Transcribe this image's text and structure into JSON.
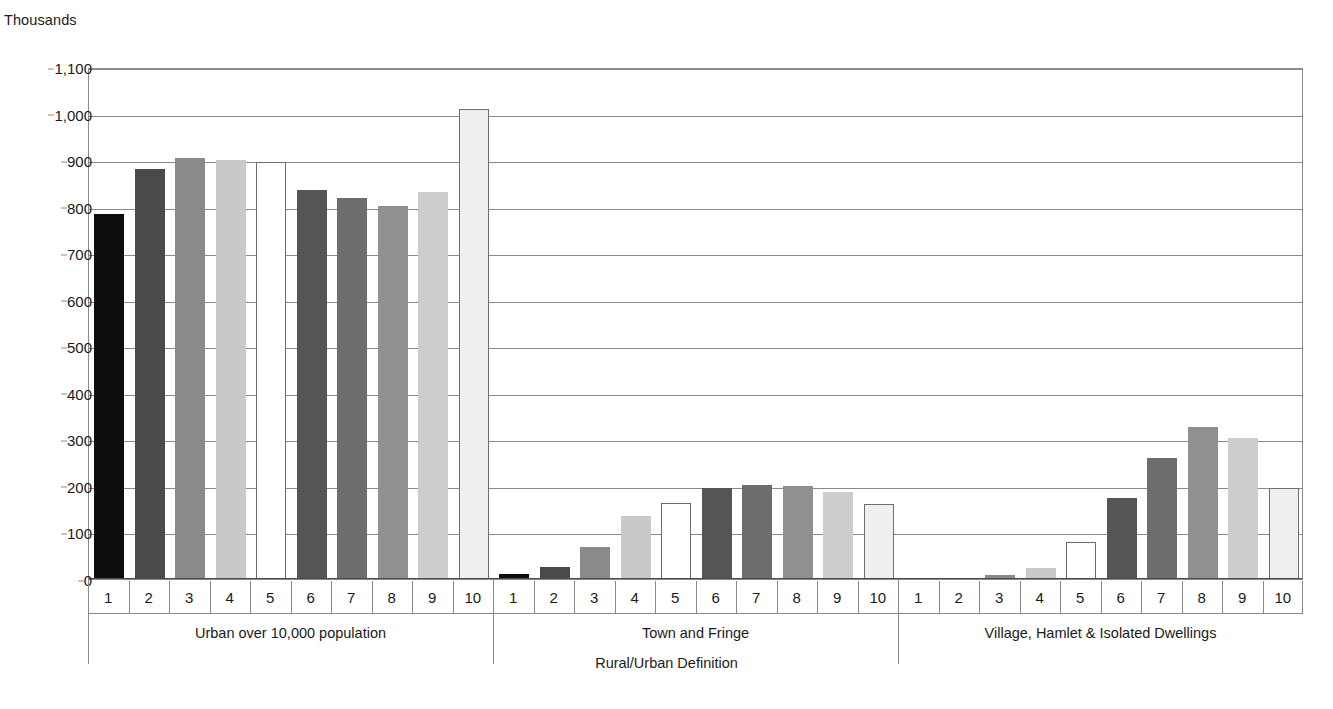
{
  "chart_data": {
    "type": "bar",
    "title": "",
    "subtitle": "",
    "unit_label": "Thousands",
    "xlabel": "Rural/Urban Definition",
    "ylabel": "Thousands",
    "ylim": [
      0,
      1100
    ],
    "ytick_step": 100,
    "yticks": [
      "0",
      "100",
      "200",
      "300",
      "400",
      "500",
      "600",
      "700",
      "800",
      "900",
      "1,000",
      "1,100"
    ],
    "ytick_values": [
      0,
      100,
      200,
      300,
      400,
      500,
      600,
      700,
      800,
      900,
      1000,
      1100
    ],
    "grid": true,
    "legend": "none",
    "categories": [
      "1",
      "2",
      "3",
      "4",
      "5",
      "6",
      "7",
      "8",
      "9",
      "10"
    ],
    "groups": [
      {
        "name": "Urban over 10,000 population",
        "values": [
          785,
          880,
          905,
          900,
          895,
          836,
          818,
          802,
          832,
          1009
        ]
      },
      {
        "name": "Town and Fringe",
        "values": [
          10,
          25,
          68,
          136,
          164,
          196,
          201,
          200,
          188,
          161
        ]
      },
      {
        "name": "Village, Hamlet & Isolated Dwellings",
        "values": [
          0,
          0,
          9,
          23,
          80,
          173,
          261,
          326,
          303,
          196
        ]
      }
    ],
    "bar_colors": [
      "#0d0d0d",
      "#4a4a4a",
      "#8a8a8a",
      "#c9c9c9",
      "#ffffff",
      "#555555",
      "#6d6d6d",
      "#909090",
      "#cdcdcd",
      "#efefef"
    ],
    "bar_border_color": "#6e6e6e",
    "axis_color": "#8a8a8a"
  }
}
